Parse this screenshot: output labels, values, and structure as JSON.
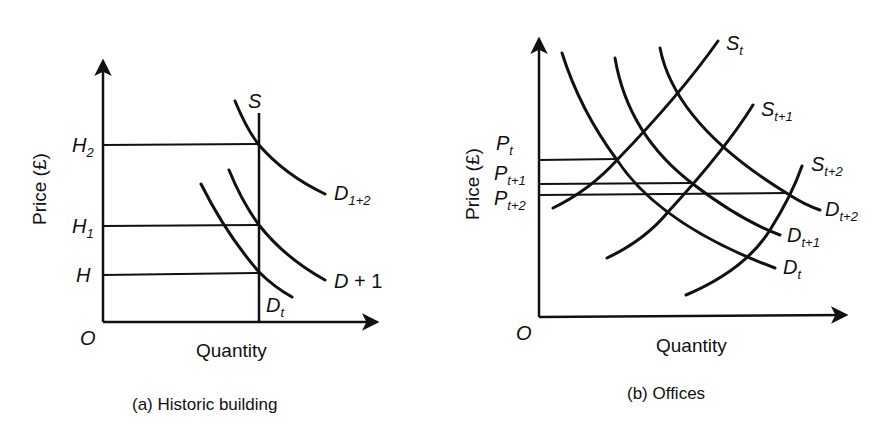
{
  "figure": {
    "panel_a": {
      "caption": "(a) Historic building",
      "x_axis_label": "Quantity",
      "y_axis_label": "Price (£)",
      "origin_label": "O",
      "price_levels": [
        {
          "base": "H",
          "sub": "2"
        },
        {
          "base": "H",
          "sub": "1"
        },
        {
          "base": "H",
          "sub": ""
        }
      ],
      "supply": {
        "label": "S",
        "type": "vertical (perfectly inelastic)"
      },
      "demand_curves": [
        {
          "base": "D",
          "sub": "1+2"
        },
        {
          "base": "D",
          "suffix": " + 1"
        },
        {
          "base": "D",
          "sub": "t"
        }
      ]
    },
    "panel_b": {
      "caption": "(b) Offices",
      "x_axis_label": "Quantity",
      "y_axis_label": "Price (£)",
      "origin_label": "O",
      "price_levels": [
        {
          "base": "P",
          "sub": "t"
        },
        {
          "base": "P",
          "sub": "t+1"
        },
        {
          "base": "P",
          "sub": "t+2"
        }
      ],
      "supply_curves": [
        {
          "base": "S",
          "sub": "t"
        },
        {
          "base": "S",
          "sub": "t+1"
        },
        {
          "base": "S",
          "sub": "t+2"
        }
      ],
      "demand_curves": [
        {
          "base": "D",
          "sub": "t+2"
        },
        {
          "base": "D",
          "sub": "t+1"
        },
        {
          "base": "D",
          "sub": "t"
        }
      ]
    }
  }
}
